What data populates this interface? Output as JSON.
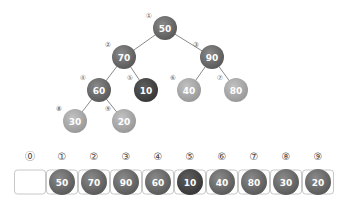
{
  "tree": {
    "nodes": [
      {
        "index": "①",
        "value": "50",
        "x": 165,
        "y": 28,
        "shade": "mid"
      },
      {
        "index": "②",
        "value": "70",
        "x": 124,
        "y": 57,
        "shade": "mid"
      },
      {
        "index": "③",
        "value": "90",
        "x": 212,
        "y": 57,
        "shade": "mid"
      },
      {
        "index": "④",
        "value": "60",
        "x": 99,
        "y": 90,
        "shade": "mid"
      },
      {
        "index": "⑤",
        "value": "10",
        "x": 146,
        "y": 90,
        "shade": "dark"
      },
      {
        "index": "⑥",
        "value": "40",
        "x": 189,
        "y": 90,
        "shade": "light"
      },
      {
        "index": "⑦",
        "value": "80",
        "x": 236,
        "y": 90,
        "shade": "light"
      },
      {
        "index": "⑧",
        "value": "30",
        "x": 75,
        "y": 121,
        "shade": "light"
      },
      {
        "index": "⑨",
        "value": "20",
        "x": 124,
        "y": 121,
        "shade": "light"
      }
    ],
    "edges": [
      [
        0,
        1
      ],
      [
        0,
        2
      ],
      [
        1,
        3
      ],
      [
        1,
        4
      ],
      [
        2,
        5
      ],
      [
        2,
        6
      ],
      [
        3,
        7
      ],
      [
        3,
        8
      ]
    ]
  },
  "array": {
    "indices": [
      "⓪",
      "①",
      "②",
      "③",
      "④",
      "⑤",
      "⑥",
      "⑦",
      "⑧",
      "⑨"
    ],
    "values": [
      "",
      "50",
      "70",
      "90",
      "60",
      "10",
      "40",
      "80",
      "30",
      "20"
    ],
    "shades": [
      "",
      "mid",
      "mid",
      "mid",
      "mid",
      "dark",
      "mid",
      "mid",
      "mid",
      "mid"
    ]
  },
  "colors": {
    "mid": "#6b6b6b",
    "dark": "#4a4a4a",
    "light": "#a9a9a9",
    "edge": "#8a8a8a",
    "cell_border": "#c8c8c8"
  }
}
